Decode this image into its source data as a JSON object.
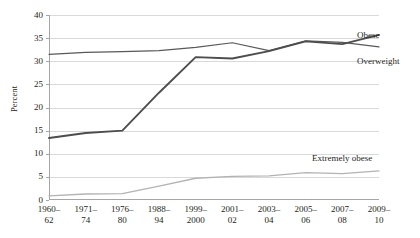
{
  "chart_data": {
    "type": "line",
    "title": "",
    "subtitle": "",
    "xlabel": "",
    "ylabel": "Percent",
    "ylim": [
      0,
      40
    ],
    "yticks": [
      0,
      5,
      10,
      15,
      20,
      25,
      30,
      35,
      40
    ],
    "ytick_labels": [
      "0",
      "5",
      "10",
      "15",
      "20",
      "25",
      "30",
      "35",
      "40"
    ],
    "grid": true,
    "legend_position": "inline-right",
    "categories": [
      "1960–62",
      "1971–74",
      "1976–80",
      "1988–94",
      "1999–2000",
      "2001–02",
      "2003–04",
      "2005–06",
      "2007–08",
      "2009–10"
    ],
    "category_lines": [
      {
        "l1": "1960–",
        "l2": "62"
      },
      {
        "l1": "1971–",
        "l2": "74"
      },
      {
        "l1": "1976–",
        "l2": "80"
      },
      {
        "l1": "1988–",
        "l2": "94"
      },
      {
        "l1": "1999–",
        "l2": "2000"
      },
      {
        "l1": "2001–",
        "l2": "02"
      },
      {
        "l1": "2003–",
        "l2": "04"
      },
      {
        "l1": "2005–",
        "l2": "06"
      },
      {
        "l1": "2007–",
        "l2": "08"
      },
      {
        "l1": "2009–",
        "l2": "10"
      }
    ],
    "series": [
      {
        "name": "Overweight",
        "color": "#595959",
        "width": 1.2,
        "values": [
          31.5,
          31.9,
          32.1,
          32.3,
          33.0,
          34.0,
          32.3,
          34.4,
          34.1,
          33.1
        ]
      },
      {
        "name": "Obese",
        "color": "#4d4d4d",
        "width": 1.9,
        "values": [
          13.4,
          14.5,
          15.0,
          23.2,
          30.9,
          30.6,
          32.2,
          34.3,
          33.7,
          35.7
        ]
      },
      {
        "name": "Extremely obese",
        "color": "#b3b3b3",
        "width": 1.3,
        "values": [
          0.9,
          1.3,
          1.4,
          3.0,
          4.7,
          5.1,
          5.2,
          5.9,
          5.7,
          6.3
        ]
      }
    ],
    "annotations": [
      {
        "text": "Obese",
        "series": "Obese"
      },
      {
        "text": "Overweight",
        "series": "Overweight"
      },
      {
        "text": "Extremely obese",
        "series": "Extremely obese"
      }
    ],
    "colors": {
      "axis": "#a6a6a6",
      "grid": "#d9d9d9",
      "text": "#231f20",
      "background": "#ffffff"
    }
  }
}
